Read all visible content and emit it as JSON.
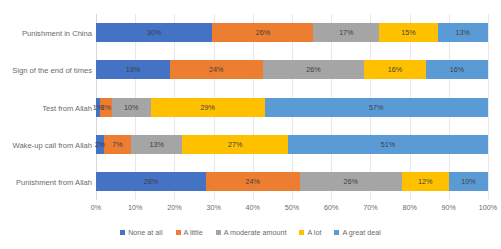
{
  "chart_data": {
    "type": "bar",
    "orientation": "horizontal",
    "stacked": true,
    "stack_mode": "percent",
    "title": "",
    "subtitle": "",
    "xlabel": "",
    "ylabel": "",
    "xlim": [
      0,
      100
    ],
    "xticks": [
      "0%",
      "10%",
      "20%",
      "30%",
      "40%",
      "50%",
      "60%",
      "70%",
      "80%",
      "90%",
      "100%"
    ],
    "xtick_values": [
      0,
      10,
      20,
      30,
      40,
      50,
      60,
      70,
      80,
      90,
      100
    ],
    "grid": true,
    "grid_axis": "x",
    "legend_position": "bottom",
    "categories": [
      "Punishment in China",
      "Sign of the end of times",
      "Test from Allah",
      "Wake-up call from Allah",
      "Punishment from Allah"
    ],
    "series": [
      {
        "name": "None at all",
        "color": "#4472C4",
        "values": [
          30,
          19,
          1,
          2,
          28
        ],
        "labels": [
          "30%",
          "19%",
          "1%",
          "2%",
          "28%"
        ]
      },
      {
        "name": "A little",
        "color": "#ED7D31",
        "values": [
          26,
          24,
          3,
          7,
          24
        ],
        "labels": [
          "26%",
          "24%",
          "3%",
          "7%",
          "24%"
        ]
      },
      {
        "name": "A moderate amount",
        "color": "#A5A5A5",
        "values": [
          17,
          26,
          10,
          13,
          26
        ],
        "labels": [
          "17%",
          "26%",
          "10%",
          "13%",
          "26%"
        ]
      },
      {
        "name": "A lot",
        "color": "#FFC000",
        "values": [
          15,
          16,
          29,
          27,
          12
        ],
        "labels": [
          "15%",
          "16%",
          "29%",
          "27%",
          "12%"
        ]
      },
      {
        "name": "A great deal",
        "color": "#5B9BD5",
        "values": [
          13,
          16,
          57,
          51,
          10
        ],
        "labels": [
          "13%",
          "16%",
          "57%",
          "51%",
          "10%"
        ]
      }
    ]
  },
  "colors": {
    "none_at_all": "#4472C4",
    "a_little": "#ED7D31",
    "a_moderate_amount": "#A5A5A5",
    "a_lot": "#FFC000",
    "a_great_deal": "#5B9BD5",
    "gridline": "#E8E8E8",
    "text": "#6B6B6B",
    "background": "#FFFFFF"
  }
}
